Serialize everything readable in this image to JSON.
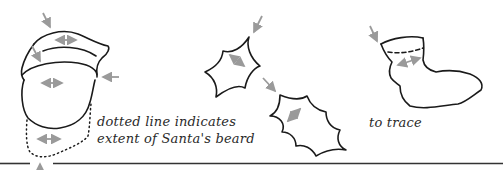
{
  "figure": {
    "captions": {
      "beard_line1": "dotted line indicates",
      "beard_line2": "extent of Santa's beard",
      "trace": "to trace"
    },
    "shapes": [
      {
        "name": "santa-hat-and-face",
        "description": "Santa hat with brim over oval face, dotted beard outline below"
      },
      {
        "name": "holly-leaf-small",
        "description": "small holly leaf outline"
      },
      {
        "name": "holly-leaf-large",
        "description": "larger holly leaf outline"
      },
      {
        "name": "stocking",
        "description": "Christmas stocking outline with dashed fold line"
      }
    ],
    "colors": {
      "outline": "#1a1a1a",
      "arrow": "#9a9a9a",
      "rule": "#333333",
      "background": "#ffffff"
    }
  }
}
